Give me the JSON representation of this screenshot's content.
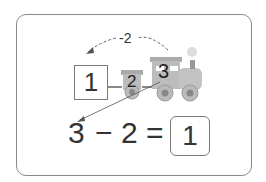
{
  "diagram": {
    "arc_label": "-2",
    "start_box": "1",
    "train": {
      "car_number": "2",
      "engine_number": "3"
    },
    "equation": {
      "minuend": "3",
      "operator": "−",
      "subtrahend": "2",
      "equals": "=",
      "answer": "1"
    },
    "colors": {
      "border": "#8a8a8a",
      "text": "#333333",
      "train": "#b5b5b5"
    }
  }
}
